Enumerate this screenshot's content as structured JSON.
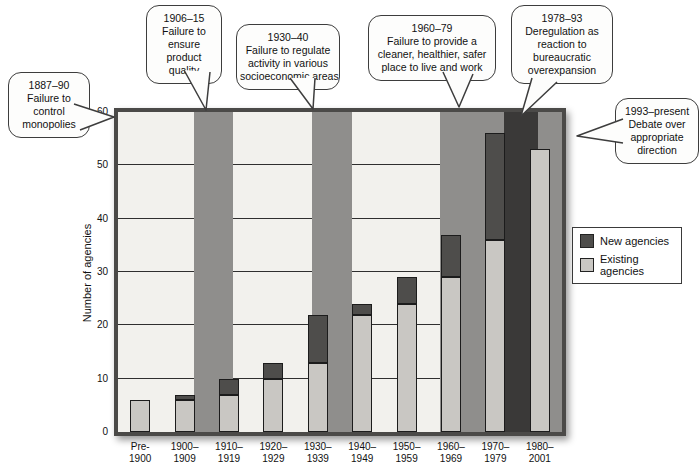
{
  "chart_data": {
    "type": "bar",
    "stacked": true,
    "title": "",
    "xlabel": "",
    "ylabel": "Number of agencies",
    "ylim": [
      0,
      60
    ],
    "yticks": [
      0,
      10,
      20,
      30,
      40,
      50,
      60
    ],
    "grid": "horizontal",
    "legend_position": "right",
    "plot_bg": "#f2f1ed",
    "gridline_color": "#2f2f2f",
    "frame_color": "#4b4a48",
    "band_colors": {
      "medium": "#8f8e8c",
      "dark": "#3a3938"
    },
    "categories": [
      "Pre-1900",
      "1900–1909",
      "1910–1919",
      "1920–1929",
      "1930–1939",
      "1940–1949",
      "1950–1959",
      "1960–1969",
      "1970–1979",
      "1980–2001"
    ],
    "category_labels": [
      [
        "Pre-",
        "1900"
      ],
      [
        "1900–",
        "1909"
      ],
      [
        "1910–",
        "1919"
      ],
      [
        "1920–",
        "1929"
      ],
      [
        "1930–",
        "1939"
      ],
      [
        "1940–",
        "1949"
      ],
      [
        "1950–",
        "1959"
      ],
      [
        "1960–",
        "1969"
      ],
      [
        "1970–",
        "1979"
      ],
      [
        "1980–",
        "2001"
      ]
    ],
    "series": [
      {
        "name": "New agencies",
        "color": "#4e4d4b",
        "values": [
          0,
          1,
          3,
          3,
          9,
          2,
          5,
          8,
          20,
          0
        ]
      },
      {
        "name": "Existing agencies",
        "color": "#c9c7c3",
        "values": [
          6,
          6,
          7,
          10,
          13,
          22,
          24,
          29,
          36,
          53
        ]
      }
    ],
    "era_bands": [
      {
        "era": "1906–15",
        "shade": "medium",
        "left_px": 76,
        "width_px": 39
      },
      {
        "era": "1930–40",
        "shade": "medium",
        "left_px": 194,
        "width_px": 40
      },
      {
        "era": "1960–79",
        "shade": "medium",
        "left_px": 322,
        "width_px": 64
      },
      {
        "era": "1978–93",
        "shade": "dark",
        "left_px": 386,
        "width_px": 34
      },
      {
        "era": "1993–present",
        "shade": "medium",
        "left_px": 420,
        "width_px": 24
      }
    ]
  },
  "legend": {
    "items": [
      {
        "label": "New agencies"
      },
      {
        "label": "Existing agencies"
      }
    ]
  },
  "callouts": [
    {
      "id": "1887-90",
      "lines": [
        "1887–90",
        "Failure to",
        "control",
        "monopolies"
      ]
    },
    {
      "id": "1906-15",
      "lines": [
        "1906–15",
        "Failure to",
        "ensure",
        "product",
        "quality"
      ]
    },
    {
      "id": "1930-40",
      "lines": [
        "1930–40",
        "Failure to regulate",
        "activity in various",
        "socioeconomic areas"
      ]
    },
    {
      "id": "1960-79",
      "lines": [
        "1960–79",
        "Failure to provide a",
        "cleaner, healthier, safer",
        "place to live and work"
      ]
    },
    {
      "id": "1978-93",
      "lines": [
        "1978–93",
        "Deregulation as",
        "reaction to",
        "bureaucratic",
        "overexpansion"
      ]
    },
    {
      "id": "1993-present",
      "lines": [
        "1993–present",
        "Debate over",
        "appropriate",
        "direction"
      ]
    }
  ]
}
